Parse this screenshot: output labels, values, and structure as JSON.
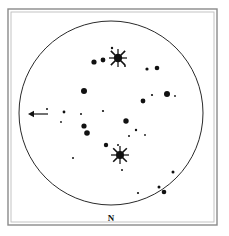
{
  "figure": {
    "kind": "finder-chart",
    "background_color": "#ffffff",
    "ink_color": "#111111",
    "frame_color": "#8a8a8a",
    "inner_frame_color": "#bdbdbd"
  },
  "labels": {
    "north": "N"
  },
  "chart_data": {
    "type": "scatter",
    "title": "",
    "subtitle": "",
    "xlabel": "",
    "ylabel": "",
    "grid": false,
    "legend": null,
    "xlim": [
      0,
      229
    ],
    "ylim": [
      0,
      236
    ],
    "frame": {
      "outer": {
        "x": 8,
        "y": 9,
        "width": 209,
        "height": 216
      },
      "inner": {
        "x": 11,
        "y": 12,
        "width": 203,
        "height": 210
      }
    },
    "field_of_view_circle": {
      "cx": 111,
      "cy": 113,
      "r": 92
    },
    "direction_marker": {
      "label": "N",
      "x": 111,
      "y": 219
    },
    "arrow_annotation": {
      "points_to": "left",
      "tail_x": 48,
      "tip_x": 28,
      "y": 114
    },
    "stars": [
      {
        "x": 118,
        "y": 58,
        "r": 4.2,
        "spikes": true,
        "spike_len": 9,
        "mag": 1
      },
      {
        "x": 120,
        "y": 155,
        "r": 4.0,
        "spikes": true,
        "spike_len": 9,
        "mag": 1
      },
      {
        "x": 103,
        "y": 60,
        "r": 2.4,
        "spikes": false,
        "mag": 3
      },
      {
        "x": 94,
        "y": 62,
        "r": 2.6,
        "spikes": false,
        "mag": 3
      },
      {
        "x": 112,
        "y": 48,
        "r": 1.2,
        "spikes": false,
        "mag": 6
      },
      {
        "x": 125,
        "y": 66,
        "r": 1.0,
        "spikes": false,
        "mag": 7
      },
      {
        "x": 147,
        "y": 69,
        "r": 1.6,
        "spikes": false,
        "mag": 5
      },
      {
        "x": 157,
        "y": 68,
        "r": 2.3,
        "spikes": false,
        "mag": 4
      },
      {
        "x": 84,
        "y": 91,
        "r": 3.0,
        "spikes": false,
        "mag": 2
      },
      {
        "x": 167,
        "y": 94,
        "r": 3.0,
        "spikes": false,
        "mag": 2
      },
      {
        "x": 175,
        "y": 96,
        "r": 0.9,
        "spikes": false,
        "mag": 7
      },
      {
        "x": 152,
        "y": 95,
        "r": 1.1,
        "spikes": false,
        "mag": 7
      },
      {
        "x": 143,
        "y": 101,
        "r": 2.4,
        "spikes": false,
        "mag": 4
      },
      {
        "x": 47,
        "y": 109,
        "r": 1.0,
        "spikes": false,
        "mag": 7
      },
      {
        "x": 64,
        "y": 112,
        "r": 1.4,
        "spikes": false,
        "mag": 6
      },
      {
        "x": 81,
        "y": 114,
        "r": 1.0,
        "spikes": false,
        "mag": 7
      },
      {
        "x": 61,
        "y": 122,
        "r": 0.9,
        "spikes": false,
        "mag": 7
      },
      {
        "x": 103,
        "y": 111,
        "r": 1.1,
        "spikes": false,
        "mag": 7
      },
      {
        "x": 126,
        "y": 121,
        "r": 2.7,
        "spikes": false,
        "mag": 3
      },
      {
        "x": 84,
        "y": 126,
        "r": 2.6,
        "spikes": false,
        "mag": 3
      },
      {
        "x": 87,
        "y": 133,
        "r": 2.8,
        "spikes": false,
        "mag": 3
      },
      {
        "x": 136,
        "y": 130,
        "r": 1.2,
        "spikes": false,
        "mag": 6
      },
      {
        "x": 129,
        "y": 136,
        "r": 1.0,
        "spikes": false,
        "mag": 7
      },
      {
        "x": 145,
        "y": 135,
        "r": 0.9,
        "spikes": false,
        "mag": 7
      },
      {
        "x": 106,
        "y": 145,
        "r": 2.2,
        "spikes": false,
        "mag": 4
      },
      {
        "x": 118,
        "y": 145,
        "r": 1.0,
        "spikes": false,
        "mag": 7
      },
      {
        "x": 73,
        "y": 158,
        "r": 1.0,
        "spikes": false,
        "mag": 7
      },
      {
        "x": 122,
        "y": 170,
        "r": 1.0,
        "spikes": false,
        "mag": 7
      },
      {
        "x": 173,
        "y": 172,
        "r": 1.5,
        "spikes": false,
        "mag": 6
      },
      {
        "x": 159,
        "y": 187,
        "r": 1.5,
        "spikes": false,
        "mag": 6
      },
      {
        "x": 164,
        "y": 192,
        "r": 2.3,
        "spikes": false,
        "mag": 4
      },
      {
        "x": 138,
        "y": 193,
        "r": 1.1,
        "spikes": false,
        "mag": 7
      }
    ]
  }
}
